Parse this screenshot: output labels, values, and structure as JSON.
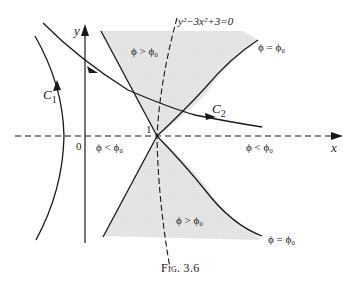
{
  "figure": {
    "caption": "Fig. 3.6",
    "axes": {
      "x_label": "x",
      "y_label": "y",
      "origin_label": "0",
      "saddle_label": "1"
    },
    "curves": {
      "dashed_curve_label": "y²−3x²+3=0",
      "c1_label": "C",
      "c1_sub": "1",
      "c2_label": "C",
      "c2_sub": "2"
    },
    "regions": {
      "top_region": "ϕ > ϕ₀",
      "bottom_region": "ϕ > ϕ₀",
      "left_region": "ϕ < ϕ₀",
      "right_region": "ϕ < ϕ₀",
      "upper_boundary": "ϕ = ϕ₀",
      "lower_boundary": "ϕ = ϕ₀"
    },
    "colors": {
      "line": "#1a1a1a",
      "shade": "#e4e4e4"
    }
  }
}
